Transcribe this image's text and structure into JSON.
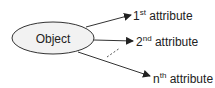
{
  "diagram": {
    "object": {
      "label": "Object"
    },
    "attributes": [
      {
        "base": "1",
        "suffix": "st",
        "text": " attribute"
      },
      {
        "base": "2",
        "suffix": "nd",
        "text": " attribute"
      },
      {
        "base": "n",
        "suffix": "th",
        "text": " attribute"
      }
    ],
    "colors": {
      "ellipse_fill": "#f2f2f2",
      "stroke": "#333333",
      "text": "#222222"
    }
  }
}
